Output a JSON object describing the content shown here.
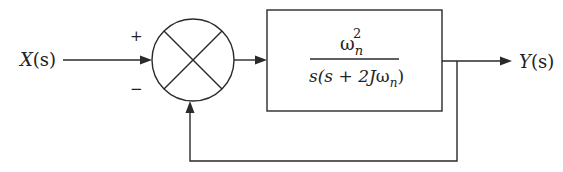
{
  "diagram": {
    "type": "closed-loop block diagram (unity negative feedback)",
    "input": {
      "label": "X(s)",
      "letter": "X",
      "arg": "(s)"
    },
    "output": {
      "label": "Y(s)",
      "letter": "Y",
      "arg": "(s)"
    },
    "summing_junction": {
      "plus_sign": "+",
      "minus_sign": "−"
    },
    "block": {
      "numerator": {
        "base": "ω",
        "sub": "n",
        "sup": "2"
      },
      "denominator": {
        "prefix": "s(s + 2J",
        "omega": "ω",
        "sub": "n",
        "suffix": ")"
      },
      "transfer_function_text": "ωn² / s(s + 2Jωn)"
    },
    "feedback": {
      "type": "unity",
      "sign": "negative"
    },
    "colors": {
      "stroke": "#2a2a2a",
      "text": "#222222",
      "background": "#ffffff"
    }
  }
}
